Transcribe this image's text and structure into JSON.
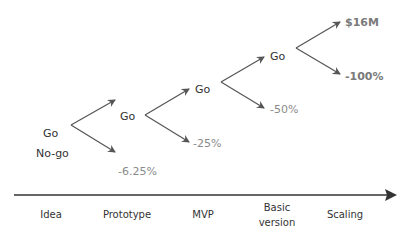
{
  "diagram": {
    "start": {
      "go_label": "Go",
      "nogo_label": "No-go"
    },
    "nodes": [
      {
        "label": "Go",
        "loss": "-6.25%"
      },
      {
        "label": "Go",
        "loss": "-25%"
      },
      {
        "label": "Go",
        "loss": "-50%"
      },
      {
        "label": "Go",
        "loss": "-100%"
      }
    ],
    "final_outcome": "$16M",
    "final_loss": "-100%",
    "stages": [
      {
        "label": "Idea"
      },
      {
        "label": "Prototype"
      },
      {
        "label": "MVP"
      },
      {
        "label_line1": "Basic",
        "label_line2": "version"
      },
      {
        "label": "Scaling"
      }
    ],
    "colors": {
      "arrow": "#555555",
      "text": "#333333",
      "loss": "#8a8a8a",
      "axis": "#333333"
    }
  }
}
